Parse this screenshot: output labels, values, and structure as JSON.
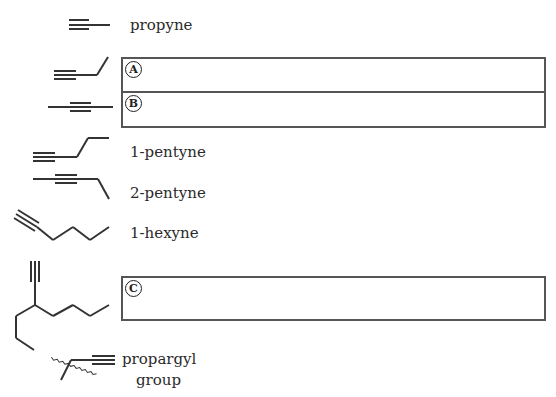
{
  "compounds": [
    {
      "name": "propyne"
    },
    {
      "name": "1-pentyne"
    },
    {
      "name": "2-pentyne"
    },
    {
      "name": "1-hexyne"
    }
  ],
  "propargyl": {
    "line1": "propargyl",
    "line2": "group"
  },
  "answer_boxes": [
    {
      "marker": "A",
      "value": ""
    },
    {
      "marker": "B",
      "value": ""
    },
    {
      "marker": "C",
      "value": ""
    }
  ]
}
